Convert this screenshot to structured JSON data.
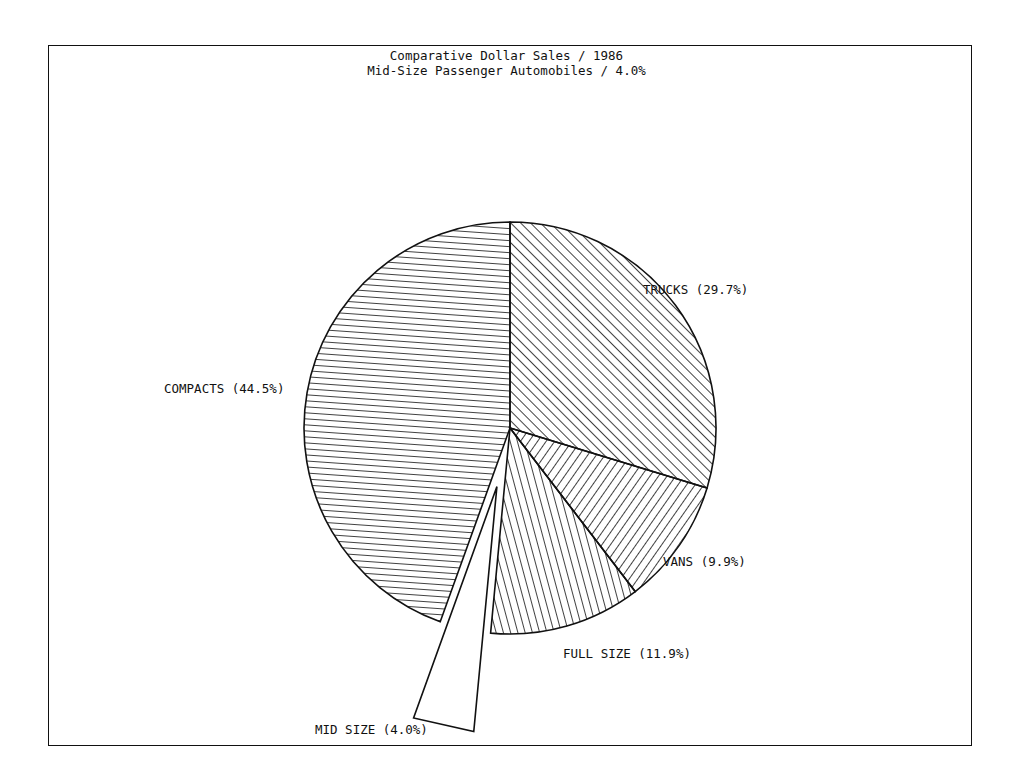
{
  "chart_data": {
    "type": "pie",
    "title": "Comparative Dollar Sales / 1986",
    "subtitle": "Mid-Size Passenger Automobiles / 4.0%",
    "slices": [
      {
        "label": "TRUCKS",
        "value": 29.7,
        "display": "TRUCKS (29.7%)",
        "hatch": "diag-up",
        "exploded": false
      },
      {
        "label": "VANS",
        "value": 9.9,
        "display": "VANS (9.9%)",
        "hatch": "diag-down",
        "exploded": false
      },
      {
        "label": "FULL SIZE",
        "value": 11.9,
        "display": "FULL SIZE (11.9%)",
        "hatch": "steep-down",
        "exploded": false
      },
      {
        "label": "MID SIZE",
        "value": 4.0,
        "display": "MID SIZE (4.0%)",
        "hatch": "none",
        "exploded": true
      },
      {
        "label": "COMPACTS",
        "value": 44.5,
        "display": "COMPACTS (44.5%)",
        "hatch": "horizontal",
        "exploded": false
      }
    ],
    "start_angle": "12 o'clock",
    "direction": "clockwise",
    "legend": "none (labels beside slices)",
    "colors": {
      "ink": "#111111",
      "background": "#ffffff"
    }
  }
}
